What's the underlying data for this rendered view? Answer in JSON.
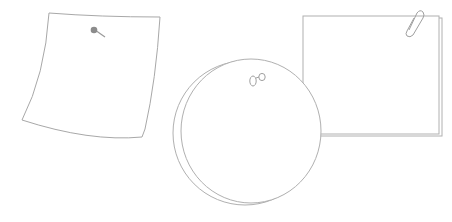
{
  "scene": {
    "description": "Three blank note papers illustration",
    "stroke_color": "#a8a8a8",
    "pin_color": "#8c8c8c",
    "background": "#ffffff"
  },
  "notes": [
    {
      "kind": "curled-note",
      "fastener": "pushpin-icon"
    },
    {
      "kind": "round-note",
      "fastener": "binder-clips-icon"
    },
    {
      "kind": "square-note-stack",
      "fastener": "paperclip-icon"
    }
  ]
}
